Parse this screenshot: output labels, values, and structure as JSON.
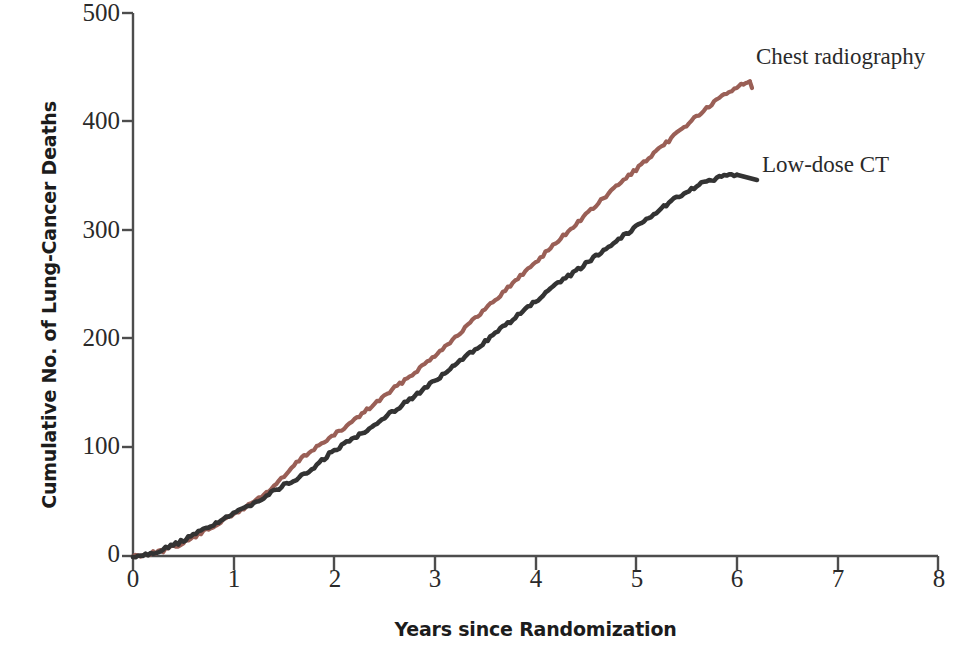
{
  "chart_data": {
    "type": "line",
    "title": "",
    "subtitle": "",
    "xlabel": "Years since Randomization",
    "ylabel": "Cumulative No. of Lung-Cancer Deaths",
    "xlim": [
      0,
      8
    ],
    "ylim": [
      0,
      500
    ],
    "xticks": [
      "0",
      "1",
      "2",
      "3",
      "4",
      "5",
      "6",
      "7",
      "8"
    ],
    "yticks": [
      "0",
      "100",
      "200",
      "300",
      "400",
      "500"
    ],
    "grid": false,
    "legend_position": "inline-annotation",
    "series": [
      {
        "name": "Chest radiography",
        "color": "#9a5f56",
        "x": [
          0,
          0.15,
          0.3,
          0.45,
          0.6,
          0.75,
          0.9,
          1.05,
          1.2,
          1.35,
          1.5,
          1.65,
          1.8,
          1.95,
          2.1,
          2.25,
          2.4,
          2.55,
          2.7,
          2.85,
          3.0,
          3.15,
          3.3,
          3.45,
          3.6,
          3.75,
          3.9,
          4.05,
          4.2,
          4.35,
          4.5,
          4.65,
          4.8,
          4.95,
          5.1,
          5.25,
          5.4,
          5.55,
          5.7,
          5.85,
          6.0,
          6.13
        ],
        "values": [
          0,
          2,
          5,
          10,
          17,
          25,
          33,
          41,
          50,
          60,
          73,
          88,
          99,
          108,
          118,
          129,
          140,
          151,
          162,
          173,
          185,
          197,
          210,
          223,
          236,
          249,
          262,
          275,
          288,
          301,
          314,
          327,
          340,
          352,
          364,
          376,
          389,
          401,
          412,
          423,
          432,
          437
        ]
      },
      {
        "name": "Low-dose CT",
        "color": "#333333",
        "x": [
          0,
          0.15,
          0.3,
          0.45,
          0.6,
          0.75,
          0.9,
          1.05,
          1.2,
          1.35,
          1.5,
          1.65,
          1.8,
          1.95,
          2.1,
          2.25,
          2.4,
          2.55,
          2.7,
          2.85,
          3.0,
          3.15,
          3.3,
          3.45,
          3.6,
          3.75,
          3.9,
          4.05,
          4.2,
          4.35,
          4.5,
          4.65,
          4.8,
          4.95,
          5.1,
          5.25,
          5.4,
          5.55,
          5.7,
          5.85,
          6.0
        ],
        "values": [
          0,
          2,
          6,
          12,
          19,
          27,
          34,
          41,
          49,
          57,
          65,
          72,
          81,
          94,
          103,
          112,
          121,
          131,
          141,
          151,
          161,
          172,
          183,
          194,
          205,
          216,
          227,
          238,
          249,
          259,
          269,
          280,
          290,
          300,
          310,
          320,
          330,
          338,
          345,
          349,
          351
        ]
      }
    ],
    "annotations": [
      {
        "text": "Chest radiography",
        "series": "Chest radiography"
      },
      {
        "text": "Low-dose CT",
        "series": "Low-dose CT"
      }
    ]
  },
  "axes": {
    "x_title": "Years since Randomization",
    "y_title": "Cumulative No. of Lung-Cancer Deaths",
    "x_tick_labels": [
      "0",
      "1",
      "2",
      "3",
      "4",
      "5",
      "6",
      "7",
      "8"
    ],
    "y_tick_labels": [
      "500",
      "400",
      "300",
      "200",
      "100",
      "0"
    ],
    "axis_color": "#4d4d4d"
  },
  "labels": {
    "chest_radiography": "Chest radiography",
    "low_dose_ct": "Low-dose CT"
  },
  "colors": {
    "chest_radiography": "#9a5f56",
    "low_dose_ct": "#333333",
    "axis": "#4d4d4d",
    "text": "#1c1c1c",
    "background": "#ffffff"
  }
}
